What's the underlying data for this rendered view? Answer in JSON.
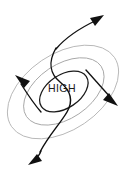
{
  "diagram": {
    "center_label": "HIGH",
    "background_color": "#ffffff",
    "isobars": {
      "count": 3,
      "description": "Concentric tilted ellipses representing isobars around a high pressure center",
      "tilt_degrees": -34,
      "center_x": 63,
      "center_y": 92,
      "rings": [
        {
          "name": "outer-isobar",
          "rx": 62,
          "ry": 38,
          "color": "#b8b8b8",
          "stroke_width": 0.9
        },
        {
          "name": "middle-isobar",
          "rx": 45,
          "ry": 27,
          "color": "#a8a8a8",
          "stroke_width": 0.9
        },
        {
          "name": "inner-isobar",
          "rx": 27,
          "ry": 16,
          "color": "#1a1a1a",
          "stroke_width": 1.25
        }
      ]
    },
    "wind_arrows": [
      {
        "name": "wind-arrow-upper-right",
        "label": "",
        "direction": "upper-right",
        "tip_x": 103,
        "tip_y": 16,
        "color": "#111111"
      },
      {
        "name": "wind-arrow-lower-left",
        "label": "",
        "direction": "lower-left",
        "tip_x": 33,
        "tip_y": 163,
        "color": "#111111"
      },
      {
        "name": "wind-arrow-upper-left",
        "label": "",
        "direction": "upper-left",
        "tip_x": 14,
        "tip_y": 76,
        "color": "#111111"
      },
      {
        "name": "wind-arrow-lower-right",
        "label": "",
        "direction": "lower-right",
        "tip_x": 117,
        "tip_y": 106,
        "color": "#111111"
      }
    ],
    "flow_curve": {
      "name": "central-s-curve",
      "description": "Sigmoid streamline passing through the high center from lower-left to upper-right",
      "color": "#111111"
    }
  }
}
